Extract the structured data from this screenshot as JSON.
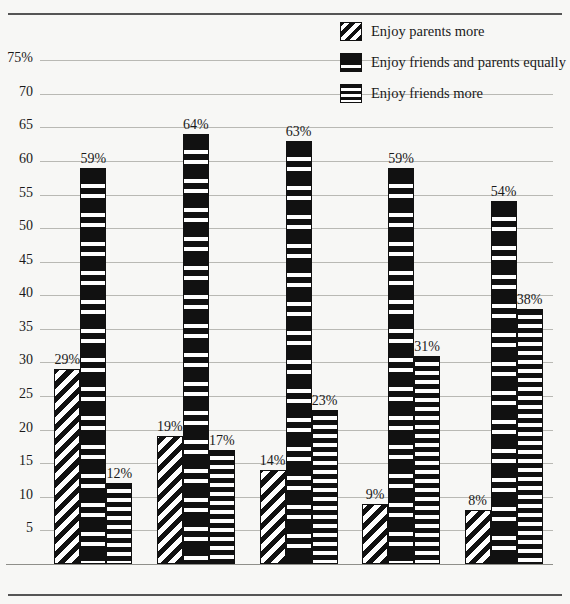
{
  "chart_data": {
    "type": "bar",
    "title": "",
    "xlabel": "",
    "ylabel": "",
    "ylim": [
      0,
      78
    ],
    "grid": true,
    "legend_position": "top-right",
    "categories": [
      "5th Grade",
      "6th Grade",
      "7th Grade",
      "8th Grade",
      "9th Grade"
    ],
    "ytick_labels": [
      "75%",
      "70",
      "65",
      "60",
      "55",
      "50",
      "45",
      "40",
      "35",
      "30",
      "25",
      "20",
      "15",
      "10",
      "5"
    ],
    "ytick_values": [
      75,
      70,
      65,
      60,
      55,
      50,
      45,
      40,
      35,
      30,
      25,
      20,
      15,
      10,
      5
    ],
    "series": [
      {
        "name": "Enjoy parents more",
        "pattern": "diagonal-stripes",
        "values": [
          29,
          19,
          14,
          9,
          8
        ],
        "labels": [
          "29%",
          "19%",
          "14%",
          "9%",
          "8%"
        ]
      },
      {
        "name": "Enjoy friends and parents equally",
        "pattern": "thick-horizontal-bands",
        "values": [
          59,
          64,
          63,
          59,
          54
        ],
        "labels": [
          "59%",
          "64%",
          "63%",
          "59%",
          "54%"
        ]
      },
      {
        "name": "Enjoy friends more",
        "pattern": "thin-horizontal-lines",
        "values": [
          12,
          17,
          23,
          31,
          38
        ],
        "labels": [
          "12%",
          "17%",
          "23%",
          "31%",
          "38%"
        ]
      }
    ]
  },
  "legend": {
    "items": [
      {
        "label": "Enjoy parents more",
        "swatch": "diagonal-stripes-swatch"
      },
      {
        "label": "Enjoy friends and parents equally",
        "swatch": "thick-bands-swatch"
      },
      {
        "label": "Enjoy friends more",
        "swatch": "thin-lines-swatch"
      }
    ]
  },
  "colors": {
    "ink": "#111111",
    "background": "#f7f7f5",
    "gridline": "#b9b9b4",
    "rule": "#555555"
  }
}
